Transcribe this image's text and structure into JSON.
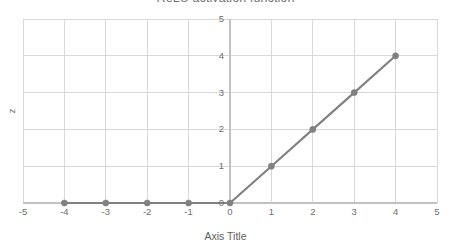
{
  "chart_data": {
    "type": "line",
    "title": "ReLU activation function",
    "xlabel": "Axis Title",
    "ylabel": "z",
    "x": [
      -4,
      -3,
      -2,
      -1,
      0,
      1,
      2,
      3,
      4
    ],
    "values": [
      0,
      0,
      0,
      0,
      0,
      1,
      2,
      3,
      4
    ],
    "series": [
      {
        "name": "ReLU",
        "values": [
          0,
          0,
          0,
          0,
          0,
          1,
          2,
          3,
          4
        ]
      }
    ],
    "xlim": [
      -5,
      5
    ],
    "ylim": [
      0,
      5
    ],
    "x_tick_labels": [
      "-5",
      "-4",
      "-3",
      "-2",
      "-1",
      "0",
      "1",
      "2",
      "3",
      "4",
      "5"
    ],
    "x_tick_values": [
      -5,
      -4,
      -3,
      -2,
      -1,
      0,
      1,
      2,
      3,
      4,
      5
    ],
    "y_tick_labels": [
      "0",
      "1",
      "2",
      "3",
      "4",
      "5"
    ],
    "y_tick_values": [
      0,
      1,
      2,
      3,
      4,
      5
    ],
    "grid": true,
    "legend": false,
    "markers": true,
    "line_color": "#808080",
    "marker_color": "#808080",
    "grid_color": "#d9d9d9",
    "text_color": "#6f6f6f",
    "background_color": "#ffffff"
  }
}
